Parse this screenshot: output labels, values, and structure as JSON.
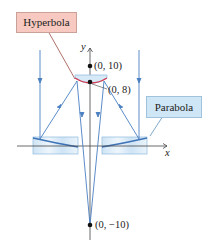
{
  "callouts": {
    "hyperbola": "Hyperbola",
    "parabola": "Parabola"
  },
  "axes": {
    "x_label": "x",
    "y_label": "y"
  },
  "points": {
    "top": "(0, 10)",
    "vertex": "(0, 8)",
    "bottom": "(0, −10)"
  },
  "colors": {
    "ray": "#4a7fc1",
    "hyperbola": "#d43a4f",
    "mirror_fill": "#d6e9f7",
    "axis": "#444444",
    "callout_hyperbola": "#f7c9c0",
    "callout_parabola": "#cfe6f6"
  }
}
